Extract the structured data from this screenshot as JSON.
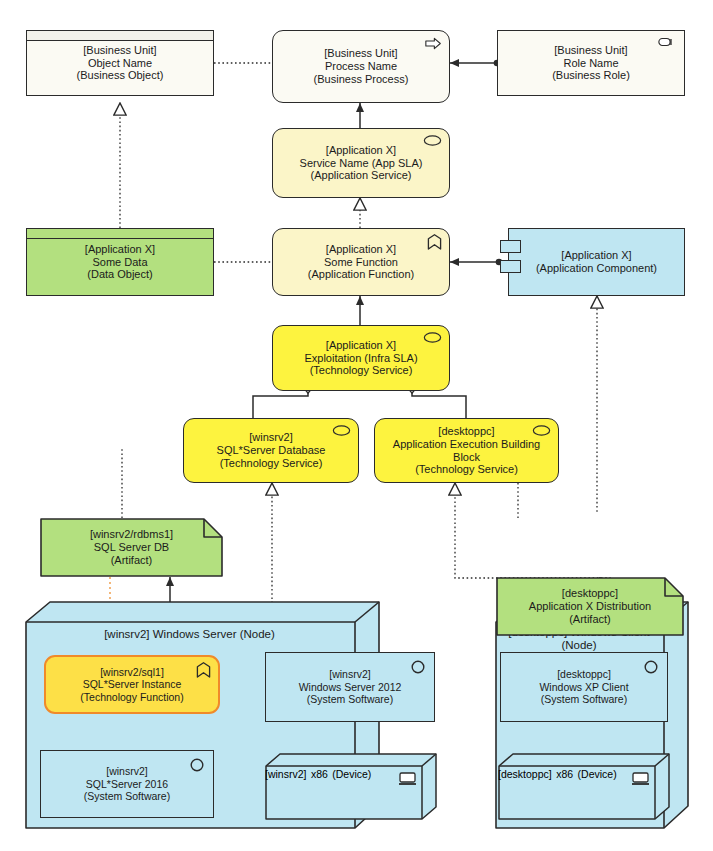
{
  "diagram": {
    "colors": {
      "business_fill": "#fbfaf3",
      "application_fill": "#fbf5c8",
      "technology_fill": "#fdf33f",
      "data_fill": "#b3e07f",
      "artifact_fill": "#b3e07f",
      "infrastructure_fill": "#bfe6f2",
      "line": "#2b2b2b",
      "assignment_accent": "#f08a2a"
    }
  },
  "elements": {
    "business_object": {
      "qualifier": "[Business Unit]",
      "name": "Object Name",
      "type": "(Business Object)",
      "icon": "business-object-icon",
      "layer": "business"
    },
    "business_process": {
      "qualifier": "[Business Unit]",
      "name": "Process Name",
      "type": "(Business Process)",
      "icon": "process-arrow-icon",
      "layer": "business"
    },
    "business_role": {
      "qualifier": "[Business Unit]",
      "name": "Role Name",
      "type": "(Business Role)",
      "icon": "business-role-icon",
      "layer": "business"
    },
    "application_service": {
      "qualifier": "[Application X]",
      "name": "Service Name (App SLA)",
      "type": "(Application Service)",
      "icon": "service-oval-icon",
      "layer": "application"
    },
    "data_object": {
      "qualifier": "[Application X]",
      "name": "Some Data",
      "type": "(Data Object)",
      "icon": "data-object-icon",
      "layer": "application"
    },
    "application_function": {
      "qualifier": "[Application X]",
      "name": "Some Function",
      "type": "(Application Function)",
      "icon": "function-arrow-icon",
      "layer": "application"
    },
    "application_component": {
      "qualifier": "[Application X]",
      "name": "",
      "type": "(Application Component)",
      "icon": "component-icon",
      "layer": "application"
    },
    "infra_service": {
      "qualifier": "[Application X]",
      "name": "Exploitation (Infra SLA)",
      "type": "(Technology Service)",
      "icon": "service-oval-icon",
      "layer": "technology"
    },
    "db_service": {
      "qualifier": "[winsrv2]",
      "name": "SQL*Server Database",
      "type": "(Technology Service)",
      "icon": "service-oval-icon",
      "layer": "technology"
    },
    "exec_service": {
      "qualifier": "[desktoppc]",
      "name": "Application Execution Building Block",
      "type": "(Technology Service)",
      "icon": "service-oval-icon",
      "layer": "technology"
    },
    "artifact_db": {
      "qualifier": "[winsrv2/rdbms1]",
      "name": "SQL Server DB",
      "type": "(Artifact)",
      "icon": "artifact-icon",
      "layer": "technology"
    },
    "artifact_dist": {
      "qualifier": "[desktoppc]",
      "name": "Application X Distribution",
      "type": "(Artifact)",
      "icon": "artifact-icon",
      "layer": "technology"
    },
    "node_server": {
      "title": "[winsrv2] Windows Server (Node)",
      "icon": "node-cube-icon",
      "layer": "technology"
    },
    "node_client": {
      "title_line1": "[desktoppc] Windows Client",
      "title_line2": "(Node)",
      "icon": "node-cube-icon",
      "layer": "technology"
    },
    "tech_function": {
      "qualifier": "[winsrv2/sql1]",
      "name": "SQL*Server Instance",
      "type": "(Technology Function)",
      "icon": "function-arrow-icon",
      "layer": "technology"
    },
    "sysw_ws2012": {
      "qualifier": "[winsrv2]",
      "name": "Windows Server 2012",
      "type": "(System Software)",
      "icon": "system-software-icon",
      "layer": "technology"
    },
    "sysw_sql2016": {
      "qualifier": "[winsrv2]",
      "name": "SQL*Server 2016",
      "type": "(System Software)",
      "icon": "system-software-icon",
      "layer": "technology"
    },
    "sysw_xp": {
      "qualifier": "[desktoppc]",
      "name": "Windows XP Client",
      "type": "(System Software)",
      "icon": "system-software-icon",
      "layer": "technology"
    },
    "device_srv": {
      "qualifier": "[winsrv2]",
      "name": "x86",
      "type": "(Device)",
      "icon": "device-monitor-icon",
      "layer": "technology"
    },
    "device_pc": {
      "qualifier": "[desktoppc]",
      "name": "x86",
      "type": "(Device)",
      "icon": "device-monitor-icon",
      "layer": "technology"
    }
  },
  "relationships": [
    {
      "from": "business_object",
      "to": "business_process",
      "style": "dotted",
      "ending": "none"
    },
    {
      "from": "business_role",
      "to": "business_process",
      "style": "solid",
      "ending": "arrow"
    },
    {
      "from": "application_service",
      "to": "business_process",
      "style": "solid",
      "ending": "arrow"
    },
    {
      "from": "application_function",
      "to": "application_service",
      "style": "dotted",
      "ending": "hollow-triangle"
    },
    {
      "from": "data_object",
      "to": "business_object",
      "style": "dotted",
      "ending": "hollow-triangle"
    },
    {
      "from": "data_object",
      "to": "application_function",
      "style": "dotted",
      "ending": "none"
    },
    {
      "from": "application_component",
      "to": "application_function",
      "style": "solid",
      "ending": "arrow"
    },
    {
      "from": "infra_service",
      "to": "application_function",
      "style": "solid",
      "ending": "arrow"
    },
    {
      "from": "application_component",
      "to": "artifact_dist",
      "style": "dotted",
      "ending": "hollow-triangle"
    },
    {
      "from": "db_service",
      "to": "infra_service",
      "style": "solid",
      "ending": "diamond"
    },
    {
      "from": "exec_service",
      "to": "infra_service",
      "style": "solid",
      "ending": "diamond"
    },
    {
      "from": "artifact_db",
      "to": "db_service",
      "style": "dotted",
      "ending": "none"
    },
    {
      "from": "node_server",
      "to": "db_service",
      "style": "dotted",
      "ending": "hollow-triangle"
    },
    {
      "from": "node_client",
      "to": "exec_service",
      "style": "dotted",
      "ending": "hollow-triangle"
    },
    {
      "from": "artifact_dist",
      "to": "exec_service",
      "style": "dotted",
      "ending": "none"
    },
    {
      "from": "node_server",
      "to": "artifact_db",
      "style": "solid",
      "ending": "arrow"
    },
    {
      "from": "node_client",
      "to": "artifact_dist",
      "style": "solid",
      "ending": "arrow"
    },
    {
      "from": "artifact_db",
      "to": "tech_function",
      "style": "dotted-orange",
      "ending": "none"
    },
    {
      "from": "sysw_sql2016",
      "to": "tech_function",
      "style": "solid-orange",
      "ending": "arrow"
    },
    {
      "from": "device_srv",
      "to": "sysw_ws2012",
      "style": "solid",
      "ending": "arrow"
    },
    {
      "from": "device_srv",
      "to": "sysw_sql2016",
      "style": "solid",
      "ending": "arrow"
    },
    {
      "from": "sysw_ws2012",
      "to": "sysw_sql2016",
      "style": "solid",
      "ending": "arrow"
    },
    {
      "from": "device_pc",
      "to": "sysw_xp",
      "style": "solid",
      "ending": "arrow"
    }
  ]
}
